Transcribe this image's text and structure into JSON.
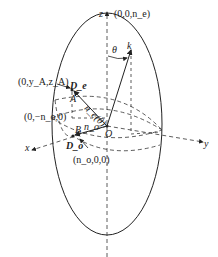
{
  "diagram": {
    "axes": {
      "z": "z",
      "y": "y",
      "x": "x",
      "origin": "O"
    },
    "points": {
      "top": "(0,0,n_e)",
      "A_coord": "(0,y_A,z_A)",
      "neg_no": "(0,−n_o,0)",
      "B_coord": "(n_o,0,0)",
      "A": "A",
      "B": "B"
    },
    "vectors": {
      "k": "k",
      "ne_theta": "n_e(θ)",
      "no": "n_o",
      "De": "D_e",
      "Do": "D_o"
    },
    "angle": "θ",
    "colors": {
      "line": "#222222",
      "background": "#ffffff"
    }
  }
}
